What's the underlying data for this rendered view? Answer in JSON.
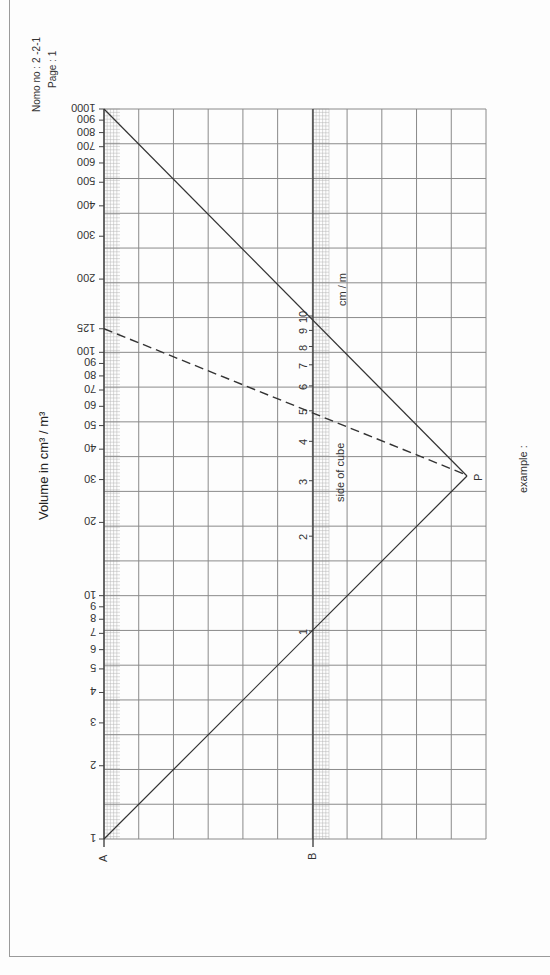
{
  "header": {
    "nomo_no": "Nomo no : 2 -2-1",
    "page": "Page     : 1"
  },
  "labels": {
    "volume_axis": "Volume  in cm³ / m³",
    "side_axis": "side of cube",
    "side_unit": "cm  /  m",
    "axis_a": "A",
    "axis_b": "B",
    "pivot": "P",
    "example": "example :"
  },
  "colors": {
    "grid": "#8a8a8a",
    "line": "#333333",
    "fine_grid": "#b5b5b5"
  },
  "chart_data": {
    "type": "nomogram",
    "orientation": "rotated 90 degrees",
    "axes": [
      {
        "id": "A",
        "label": "Volume  in cm³ / m³",
        "scale": "log",
        "range": [
          1,
          1000
        ],
        "ticks": [
          1,
          2,
          3,
          4,
          5,
          6,
          7,
          8,
          9,
          10,
          20,
          30,
          40,
          50,
          60,
          70,
          80,
          90,
          100,
          125,
          200,
          300,
          400,
          500,
          600,
          700,
          800,
          900,
          1000
        ]
      },
      {
        "id": "B",
        "label": "side of cube (cm / m)",
        "scale": "log",
        "range": [
          1,
          10
        ],
        "ticks": [
          1,
          2,
          3,
          4,
          5,
          6,
          7,
          8,
          9,
          10
        ]
      }
    ],
    "pivot_point": "P",
    "construction_lines": [
      {
        "from": "A=1",
        "through": "B=1",
        "to": "P",
        "style": "solid"
      },
      {
        "from": "A=1000",
        "through": "B=10",
        "to": "P",
        "style": "solid"
      }
    ],
    "example": {
      "volume": 125,
      "side": 5,
      "style": "dashed"
    },
    "grid": true
  }
}
